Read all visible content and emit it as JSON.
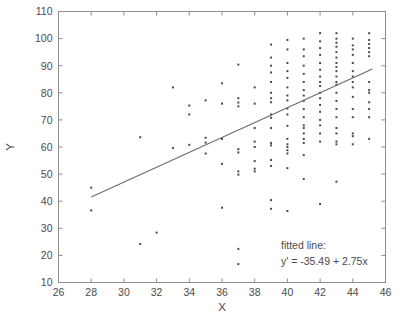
{
  "figure": {
    "background_color": "#ffffff",
    "frame_color": "#8d8d8d",
    "point_color": "#4b4b4b",
    "line_color": "#6b6b6b",
    "text_color": "#4a4a4a"
  },
  "annotation": {
    "line1": "fitted line:",
    "line2": "y' = -35.49 + 2.75x"
  },
  "chart_data": {
    "type": "scatter",
    "title": "",
    "xlabel": "X",
    "ylabel": "Y",
    "xlim": [
      26,
      46
    ],
    "ylim": [
      10,
      110
    ],
    "xticks": [
      26,
      28,
      30,
      32,
      34,
      36,
      38,
      40,
      42,
      44,
      46
    ],
    "yticks": [
      10,
      20,
      30,
      40,
      50,
      60,
      70,
      80,
      90,
      100,
      110
    ],
    "xtick_labels": [
      "26",
      "28",
      "30",
      "32",
      "34",
      "36",
      "38",
      "40",
      "42",
      "44",
      "46"
    ],
    "ytick_labels": [
      "10",
      "20",
      "30",
      "40",
      "50",
      "60",
      "70",
      "80",
      "90",
      "100",
      "110"
    ],
    "grid": false,
    "legend": null,
    "marker": "dot",
    "marker_size": 2,
    "fit_line": {
      "label": "fitted line:",
      "equation": "y' = -35.49 + 2.75x",
      "intercept": -35.49,
      "slope": 2.75,
      "x_start": 28.0,
      "x_end": 45.2
    },
    "points": [
      [
        28,
        45.0
      ],
      [
        28,
        36.6
      ],
      [
        31,
        63.6
      ],
      [
        31,
        24.2
      ],
      [
        32,
        28.4
      ],
      [
        33,
        82.0
      ],
      [
        33,
        59.6
      ],
      [
        34,
        75.3
      ],
      [
        34,
        72.0
      ],
      [
        34,
        60.8
      ],
      [
        35,
        77.2
      ],
      [
        35,
        63.4
      ],
      [
        35,
        61.6
      ],
      [
        35,
        57.6
      ],
      [
        36,
        83.5
      ],
      [
        36,
        76.0
      ],
      [
        36,
        63.0
      ],
      [
        36,
        53.8
      ],
      [
        36,
        37.6
      ],
      [
        37,
        90.4
      ],
      [
        37,
        78.0
      ],
      [
        37,
        76.4
      ],
      [
        37,
        75.0
      ],
      [
        37,
        59.2
      ],
      [
        37,
        58.0
      ],
      [
        37,
        51.0
      ],
      [
        37,
        49.8
      ],
      [
        37,
        22.4
      ],
      [
        37,
        16.8
      ],
      [
        38,
        82.0
      ],
      [
        38,
        76.0
      ],
      [
        38,
        67.0
      ],
      [
        38,
        62.0
      ],
      [
        38,
        60.0
      ],
      [
        38,
        54.8
      ],
      [
        38,
        52.0
      ],
      [
        38,
        51.0
      ],
      [
        39,
        97.8
      ],
      [
        39,
        93.0
      ],
      [
        39,
        90.0
      ],
      [
        39,
        87.5
      ],
      [
        39,
        84.0
      ],
      [
        39,
        80.0
      ],
      [
        39,
        78.0
      ],
      [
        39,
        76.5
      ],
      [
        39,
        72.0
      ],
      [
        39,
        70.8
      ],
      [
        39,
        67.0
      ],
      [
        39,
        61.5
      ],
      [
        39,
        60.6
      ],
      [
        39,
        55.2
      ],
      [
        39,
        53.0
      ],
      [
        39,
        40.4
      ],
      [
        39,
        37.2
      ],
      [
        40,
        99.5
      ],
      [
        40,
        96.0
      ],
      [
        40,
        91.0
      ],
      [
        40,
        88.0
      ],
      [
        40,
        85.5
      ],
      [
        40,
        82.0
      ],
      [
        40,
        79.0
      ],
      [
        40,
        77.2
      ],
      [
        40,
        74.2
      ],
      [
        40,
        72.0
      ],
      [
        40,
        67.8
      ],
      [
        40,
        63.0
      ],
      [
        40,
        61.0
      ],
      [
        40,
        60.0
      ],
      [
        40,
        58.8
      ],
      [
        40,
        57.6
      ],
      [
        40,
        52.2
      ],
      [
        40,
        36.4
      ],
      [
        41,
        100.0
      ],
      [
        41,
        96.0
      ],
      [
        41,
        93.5
      ],
      [
        41,
        90.0
      ],
      [
        41,
        87.0
      ],
      [
        41,
        84.0
      ],
      [
        41,
        81.0
      ],
      [
        41,
        79.0
      ],
      [
        41,
        77.0
      ],
      [
        41,
        74.0
      ],
      [
        41,
        71.0
      ],
      [
        41,
        68.0
      ],
      [
        41,
        67.0
      ],
      [
        41,
        65.0
      ],
      [
        41,
        63.0
      ],
      [
        41,
        61.5
      ],
      [
        41,
        57.0
      ],
      [
        41,
        48.2
      ],
      [
        42,
        102.0
      ],
      [
        42,
        99.0
      ],
      [
        42,
        96.5
      ],
      [
        42,
        94.0
      ],
      [
        42,
        91.0
      ],
      [
        42,
        88.5
      ],
      [
        42,
        86.0
      ],
      [
        42,
        84.0
      ],
      [
        42,
        82.5
      ],
      [
        42,
        80.0
      ],
      [
        42,
        78.0
      ],
      [
        42,
        75.5
      ],
      [
        42,
        73.0
      ],
      [
        42,
        70.0
      ],
      [
        42,
        68.0
      ],
      [
        42,
        65.0
      ],
      [
        42,
        62.0
      ],
      [
        42,
        39.0
      ],
      [
        43,
        102.0
      ],
      [
        43,
        100.0
      ],
      [
        43,
        98.5
      ],
      [
        43,
        97.0
      ],
      [
        43,
        95.0
      ],
      [
        43,
        93.0
      ],
      [
        43,
        91.0
      ],
      [
        43,
        89.5
      ],
      [
        43,
        88.0
      ],
      [
        43,
        86.0
      ],
      [
        43,
        84.0
      ],
      [
        43,
        83.0
      ],
      [
        43,
        80.0
      ],
      [
        43,
        77.0
      ],
      [
        43,
        74.0
      ],
      [
        43,
        71.0
      ],
      [
        43,
        67.0
      ],
      [
        43,
        65.0
      ],
      [
        43,
        62.0
      ],
      [
        43,
        61.0
      ],
      [
        43,
        47.2
      ],
      [
        44,
        100.0
      ],
      [
        44,
        97.5
      ],
      [
        44,
        96.0
      ],
      [
        44,
        94.0
      ],
      [
        44,
        91.0
      ],
      [
        44,
        88.0
      ],
      [
        44,
        86.0
      ],
      [
        44,
        84.0
      ],
      [
        44,
        82.0
      ],
      [
        44,
        78.5
      ],
      [
        44,
        74.0
      ],
      [
        44,
        71.0
      ],
      [
        44,
        65.0
      ],
      [
        44,
        64.0
      ],
      [
        44,
        61.0
      ],
      [
        45,
        102.0
      ],
      [
        45,
        99.5
      ],
      [
        45,
        98.0
      ],
      [
        45,
        96.5
      ],
      [
        45,
        95.0
      ],
      [
        45,
        93.5
      ],
      [
        45,
        84.0
      ],
      [
        45,
        81.0
      ],
      [
        45,
        80.0
      ],
      [
        45,
        76.5
      ],
      [
        45,
        74.0
      ],
      [
        45,
        71.0
      ],
      [
        45,
        63.0
      ]
    ]
  }
}
